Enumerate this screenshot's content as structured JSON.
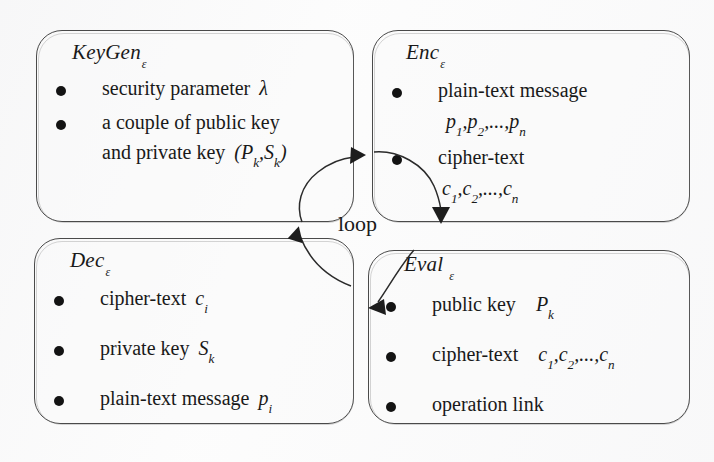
{
  "figure": {
    "loop_label": "loop",
    "background_color": "#fdfdfd",
    "stroke_color": "#2b2b2b",
    "text_color": "#191919"
  },
  "boxes": {
    "keygen": {
      "name": "KeyGen",
      "subscript": "ε",
      "items": [
        {
          "line1": "security parameter",
          "symbol1": "λ"
        },
        {
          "line1": "a couple of public key",
          "line2": "and private key",
          "symbol2": "(P",
          "sub_a": "k",
          "comma": ",",
          "symbol3": "S",
          "sub_b": "k",
          "close": ")"
        }
      ]
    },
    "enc": {
      "name": "Enc",
      "subscript": "ε",
      "items": [
        {
          "line1": "plain-text message",
          "line2_p1": "p",
          "sub1": "1",
          "sep1": ",",
          "line2_p2": "p",
          "sub2": "2",
          "sep2": ",...,",
          "line2_p3": "p",
          "sub3": "n"
        },
        {
          "line1": "cipher-text",
          "line2_c1": "c",
          "sub1": "1",
          "sep1": ",",
          "line2_c2": "c",
          "sub2": "2",
          "sep2": ",...,",
          "line2_c3": "c",
          "sub3": "n"
        }
      ]
    },
    "dec": {
      "name": "Dec",
      "subscript": "ε",
      "items": [
        {
          "label": "cipher-text",
          "symbol": "c",
          "sub": "i"
        },
        {
          "label": "private key",
          "symbol": "S",
          "sub": "k"
        },
        {
          "label": "plain-text message",
          "symbol": "p",
          "sub": "i"
        }
      ]
    },
    "eval": {
      "name": "Eval",
      "subscript": "ε",
      "items": [
        {
          "label": "public key",
          "symbol": "P",
          "sub": "k"
        },
        {
          "label": "cipher-text",
          "c1": "c",
          "sub1": "1",
          "sep1": ",",
          "c2": "c",
          "sub2": "2",
          "sep2": ",...,",
          "c3": "c",
          "sub3": "n"
        },
        {
          "label": "operation link"
        }
      ]
    }
  },
  "arrows": [
    {
      "name": "dec-to-keygen-arrow",
      "from": "Dec",
      "to": "KeyGen"
    },
    {
      "name": "keygen-to-enc-arrow",
      "from": "KeyGen",
      "to": "Enc"
    },
    {
      "name": "enc-to-eval-arrow",
      "from": "Enc",
      "to": "Eval"
    },
    {
      "name": "eval-to-dec-arrow",
      "from": "Eval",
      "to": "Dec"
    }
  ]
}
